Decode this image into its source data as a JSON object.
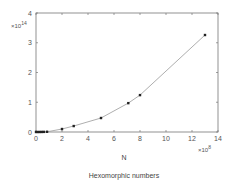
{
  "chart_data": {
    "type": "line",
    "title": "Hexomorphic numbers",
    "xlabel": "N",
    "ylabel": "",
    "x_multiplier": "×10^8",
    "y_multiplier": "×10^14",
    "xlim": [
      0,
      14
    ],
    "ylim": [
      0,
      4
    ],
    "x_ticks": [
      0,
      2,
      4,
      6,
      8,
      10,
      12,
      14
    ],
    "y_ticks": [
      0,
      1,
      2,
      3,
      4
    ],
    "grid": false,
    "markers": true,
    "series": [
      {
        "name": "Hexomorphic numbers",
        "x": [
          0.0,
          0.15,
          0.3,
          0.45,
          0.6,
          0.85,
          2.0,
          2.9,
          5.0,
          7.1,
          8.0,
          13.0
        ],
        "y": [
          0.0,
          0.0,
          0.001,
          0.002,
          0.004,
          0.008,
          0.1,
          0.2,
          0.47,
          0.97,
          1.24,
          3.26
        ]
      }
    ]
  },
  "labels": {
    "y_exp_base": "×10",
    "y_exp_power": "14",
    "x_exp_base": "×10",
    "x_exp_power": "8",
    "xlabel": "N",
    "caption": "Hexomorphic numbers"
  },
  "colors": {
    "axis": "#777777",
    "line": "#999999",
    "marker": "#222222"
  }
}
